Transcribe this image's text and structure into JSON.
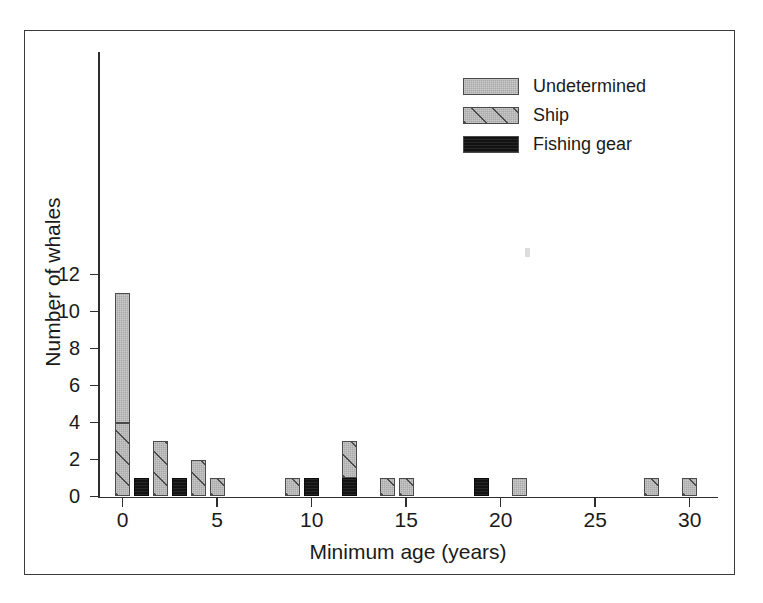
{
  "chart_data": {
    "type": "bar",
    "title": "",
    "subtitle": "",
    "xlabel": "Minimum age (years)",
    "ylabel": "Number of whales",
    "xlim": [
      -1,
      31.5
    ],
    "ylim": [
      0,
      12
    ],
    "xticks": [
      0,
      5,
      10,
      15,
      20,
      25,
      30
    ],
    "xtick_labels": [
      "0",
      "5",
      "10",
      "15",
      "20",
      "25",
      "30"
    ],
    "yticks": [
      0,
      2,
      4,
      6,
      8,
      10,
      12
    ],
    "ytick_labels": [
      "0",
      "2",
      "4",
      "6",
      "8",
      "10",
      "12"
    ],
    "grid": false,
    "stacked": true,
    "legend_position": "top-right",
    "legend_entries": [
      "Undetermined",
      "Ship",
      "Fishing gear"
    ],
    "categories": [
      0,
      1,
      2,
      3,
      4,
      5,
      9,
      10,
      12,
      14,
      15,
      19,
      21,
      28,
      30
    ],
    "series": [
      {
        "name": "Undetermined",
        "pattern": "solid-gray",
        "color": "#a8a8a8",
        "values": [
          7,
          0,
          0,
          0,
          0,
          0,
          0,
          0,
          0,
          0,
          0,
          0,
          1,
          0,
          0
        ]
      },
      {
        "name": "Ship",
        "pattern": "diagonal-hatch",
        "color": "#a8a8a8",
        "values": [
          4,
          0,
          3,
          0,
          2,
          1,
          1,
          0,
          2,
          1,
          1,
          0,
          0,
          1,
          1
        ]
      },
      {
        "name": "Fishing gear",
        "pattern": "solid-black",
        "color": "#121212",
        "values": [
          0,
          1,
          0,
          1,
          0,
          0,
          0,
          1,
          1,
          0,
          0,
          1,
          0,
          0,
          0
        ]
      }
    ],
    "totals": [
      11,
      1,
      3,
      1,
      2,
      1,
      1,
      1,
      3,
      1,
      1,
      1,
      1,
      1,
      1
    ]
  },
  "axes": {
    "x_title": "Minimum age (years)",
    "y_title": "Number of whales",
    "x_tick_labels": [
      "0",
      "5",
      "10",
      "15",
      "20",
      "25",
      "30"
    ],
    "y_tick_labels": [
      "0",
      "2",
      "4",
      "6",
      "8",
      "10",
      "12"
    ]
  },
  "legend": {
    "items": [
      {
        "label": "Undetermined",
        "pattern": "solid-gray"
      },
      {
        "label": "Ship",
        "pattern": "diagonal-hatch"
      },
      {
        "label": "Fishing gear",
        "pattern": "solid-black"
      }
    ]
  },
  "colors": {
    "gray_fill": "#a8a8a8",
    "black_fill": "#121212",
    "outline": "#4a4a4a",
    "axis": "#2e2e2e",
    "frame": "#3a3a3a",
    "text": "#1a1a1a",
    "background": "#ffffff"
  }
}
